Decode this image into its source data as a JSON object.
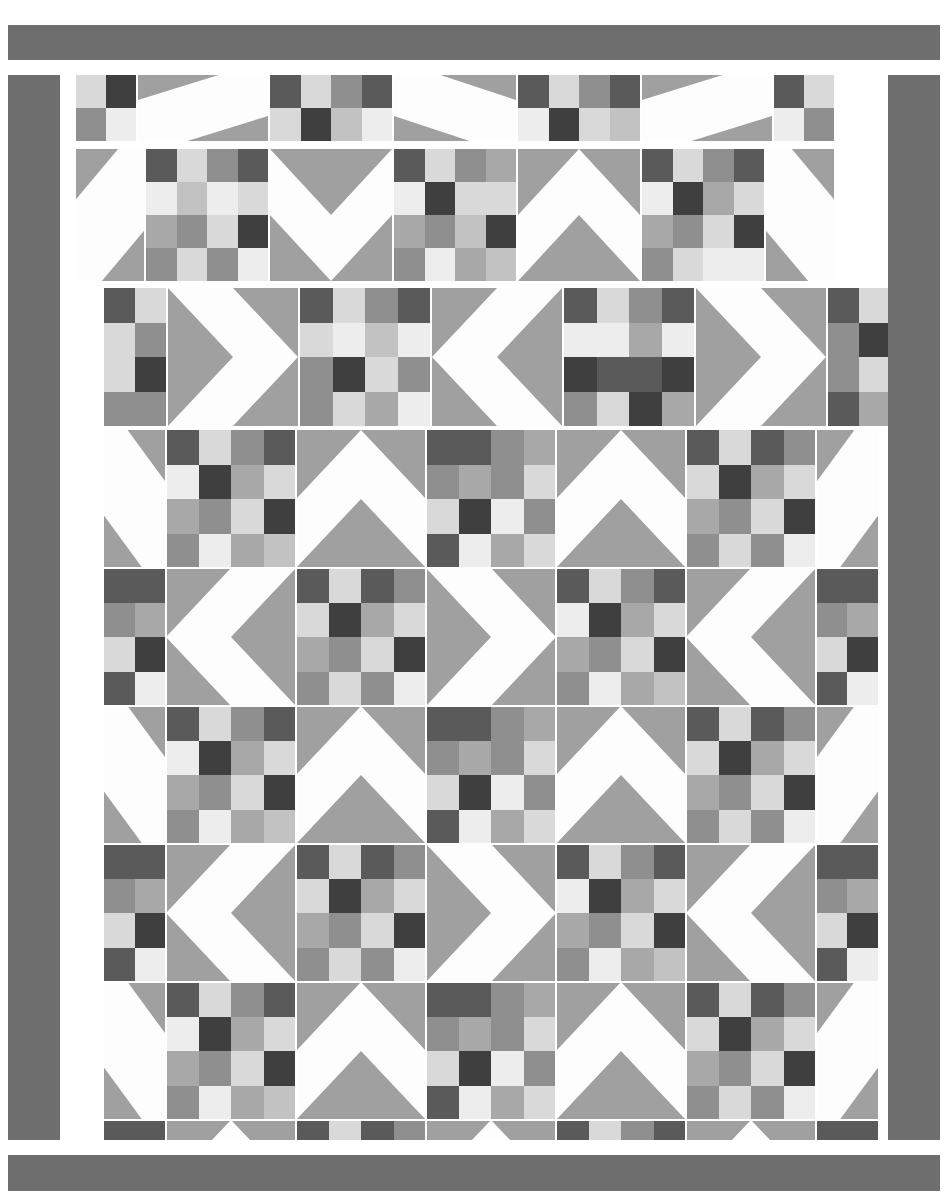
{
  "document": {
    "kind": "quilt-block-layout-diagram",
    "width": 947,
    "height": 1195,
    "background": "#ffffff"
  },
  "palette": {
    "white": "#fdfdfd",
    "lightest": "#ededed",
    "light": "#d9d9d9",
    "mid_light": "#c2c2c2",
    "mid": "#a8a8a8",
    "mid_dark": "#8f8f8f",
    "dark": "#6e6e6e",
    "darker": "#5a5a5a",
    "darkest": "#3f3f3f",
    "background_fabric": "#a0a0a0",
    "border_fabric": "#6e6e6e",
    "seam": "#ffffff"
  },
  "border": {
    "top_bar": {
      "x": 8,
      "y": 25,
      "w": 932,
      "h": 35,
      "color": "#6e6e6e"
    },
    "bottom_bar": {
      "x": 8,
      "y": 1155,
      "w": 932,
      "h": 36,
      "color": "#6e6e6e"
    },
    "left_bar": {
      "x": 8,
      "y": 75,
      "w": 52,
      "h": 1065,
      "color": "#6e6e6e"
    },
    "right_bar": {
      "x": 888,
      "y": 75,
      "w": 52,
      "h": 1065,
      "color": "#6e6e6e"
    }
  },
  "block_types": {
    "sixteen_patch": "4x4 grid of square patches in graded gray tones",
    "hst_diagonal": "square split corner-to-corner into background and white triangle",
    "chevron": "square with a white V / arrow shape on gray background"
  },
  "strip1": {
    "label": "top partial row",
    "x": 76,
    "y": 75,
    "w": 812,
    "h": 66,
    "cell_w": 114,
    "cell_h": 66,
    "gap": 2,
    "blocks": [
      {
        "type": "sixteen_patch",
        "w": 60,
        "cols": 2,
        "rows": 2,
        "patches": [
          [
            "light",
            "darkest"
          ],
          [
            "mid_dark",
            "lightest"
          ]
        ]
      },
      {
        "type": "hst_diagonal",
        "w": 130,
        "dir": "nw-se",
        "bg": "background_fabric"
      },
      {
        "type": "sixteen_patch",
        "w": 122,
        "cols": 4,
        "rows": 2,
        "patches": [
          [
            "darker",
            "light",
            "mid_dark",
            "darker"
          ],
          [
            "light",
            "darkest",
            "mid_light",
            "lightest"
          ]
        ]
      },
      {
        "type": "hst_diagonal",
        "w": 122,
        "dir": "ne-sw",
        "bg": "background_fabric"
      },
      {
        "type": "sixteen_patch",
        "w": 122,
        "cols": 4,
        "rows": 2,
        "patches": [
          [
            "darker",
            "light",
            "mid_dark",
            "darker"
          ],
          [
            "lightest",
            "darkest",
            "light",
            "mid_light"
          ]
        ]
      },
      {
        "type": "hst_diagonal",
        "w": 130,
        "dir": "nw-se",
        "bg": "background_fabric"
      },
      {
        "type": "sixteen_patch",
        "w": 60,
        "cols": 2,
        "rows": 2,
        "patches": [
          [
            "darker",
            "light"
          ],
          [
            "lightest",
            "mid_dark"
          ]
        ]
      }
    ]
  },
  "strip2": {
    "label": "second row",
    "x": 76,
    "y": 149,
    "w": 812,
    "h": 132,
    "blocks": [
      {
        "type": "hst_diagonal",
        "w": 68,
        "dir": "nw-se",
        "bg": "background_fabric"
      },
      {
        "type": "sixteen_patch",
        "w": 122,
        "cols": 4,
        "rows": 4,
        "patches": [
          [
            "darker",
            "light",
            "mid_dark",
            "darker"
          ],
          [
            "lightest",
            "mid_light",
            "lightest",
            "light"
          ],
          [
            "mid",
            "mid_dark",
            "light",
            "darkest"
          ],
          [
            "mid_dark",
            "light",
            "mid_dark",
            "lightest"
          ]
        ]
      },
      {
        "type": "chevron",
        "w": 122,
        "dir": "down",
        "bg": "background_fabric"
      },
      {
        "type": "sixteen_patch",
        "w": 122,
        "cols": 4,
        "rows": 4,
        "patches": [
          [
            "darker",
            "light",
            "mid_dark",
            "mid"
          ],
          [
            "lightest",
            "darkest",
            "light",
            "light"
          ],
          [
            "mid",
            "mid_dark",
            "mid_light",
            "darkest"
          ],
          [
            "mid_dark",
            "lightest",
            "mid",
            "mid_light"
          ]
        ]
      },
      {
        "type": "chevron",
        "w": 122,
        "dir": "up",
        "bg": "background_fabric"
      },
      {
        "type": "sixteen_patch",
        "w": 122,
        "cols": 4,
        "rows": 4,
        "patches": [
          [
            "darker",
            "light",
            "mid_dark",
            "darker"
          ],
          [
            "lightest",
            "darkest",
            "mid",
            "light"
          ],
          [
            "mid",
            "mid_dark",
            "light",
            "darkest"
          ],
          [
            "mid_dark",
            "light",
            "lightest",
            "lightest"
          ]
        ]
      },
      {
        "type": "hst_diagonal",
        "w": 68,
        "dir": "ne-sw",
        "bg": "background_fabric"
      }
    ]
  },
  "strip3": {
    "label": "third row",
    "x": 104,
    "y": 288,
    "w": 784,
    "h": 138,
    "blocks": [
      {
        "type": "sixteen_patch",
        "w": 62,
        "cols": 2,
        "rows": 4,
        "patches": [
          [
            "darker",
            "light"
          ],
          [
            "light",
            "mid_dark"
          ],
          [
            "light",
            "darkest"
          ],
          [
            "mid_dark",
            "mid_dark"
          ]
        ]
      },
      {
        "type": "chevron",
        "w": 130,
        "dir": "right",
        "bg": "background_fabric"
      },
      {
        "type": "sixteen_patch",
        "w": 130,
        "cols": 4,
        "rows": 4,
        "patches": [
          [
            "darker",
            "light",
            "mid_dark",
            "darker"
          ],
          [
            "light",
            "lightest",
            "mid_light",
            "lightest"
          ],
          [
            "mid_dark",
            "darkest",
            "light",
            "mid_dark"
          ],
          [
            "mid_dark",
            "light",
            "mid",
            "lightest"
          ]
        ]
      },
      {
        "type": "chevron",
        "w": 130,
        "dir": "left",
        "bg": "background_fabric"
      },
      {
        "type": "sixteen_patch",
        "w": 130,
        "cols": 4,
        "rows": 4,
        "patches": [
          [
            "darker",
            "light",
            "mid_dark",
            "darker"
          ],
          [
            "lightest",
            "lightest",
            "mid",
            "lightest"
          ],
          [
            "darkest",
            "darker",
            "darker",
            "darkest"
          ],
          [
            "mid_dark",
            "light",
            "darkest",
            "mid"
          ]
        ]
      },
      {
        "type": "chevron",
        "w": 130,
        "dir": "right",
        "bg": "background_fabric"
      },
      {
        "type": "sixteen_patch",
        "w": 62,
        "cols": 2,
        "rows": 4,
        "patches": [
          [
            "darker",
            "light"
          ],
          [
            "mid_dark",
            "darkest"
          ],
          [
            "mid_dark",
            "light"
          ],
          [
            "darker",
            "mid"
          ]
        ]
      }
    ]
  },
  "main_grid": {
    "label": "assembled quilt body",
    "x": 104,
    "y": 430,
    "w": 784,
    "h": 710,
    "rows": 6,
    "cols": 7,
    "col_widths": [
      62,
      130,
      130,
      130,
      130,
      130,
      62
    ],
    "row_heights": [
      138,
      138,
      138,
      138,
      138,
      62
    ],
    "layout": [
      [
        "hst-ne-sw",
        "patch",
        "chevron-up",
        "patch",
        "chevron-up",
        "patch",
        "hst-nw-se"
      ],
      [
        "patch",
        "chevron-left",
        "patch",
        "chevron-right",
        "patch",
        "chevron-left",
        "patch"
      ],
      [
        "hst-ne-sw",
        "patch",
        "chevron-up",
        "patch",
        "chevron-up",
        "patch",
        "hst-nw-se"
      ],
      [
        "patch",
        "chevron-left",
        "patch",
        "chevron-right",
        "patch",
        "chevron-left",
        "patch"
      ],
      [
        "hst-ne-sw",
        "patch",
        "chevron-up",
        "patch",
        "chevron-up",
        "patch",
        "hst-nw-se"
      ],
      [
        "patch",
        "chevron-down-half",
        "patch",
        "chevron-down-half",
        "patch",
        "chevron-down-half",
        "patch"
      ]
    ],
    "patch_variants": [
      [
        [
          "darker",
          "light",
          "mid_dark",
          "darker"
        ],
        [
          "light",
          "mid",
          "darkest",
          "light"
        ],
        [
          "lightest",
          "mid_dark",
          "lightest",
          "mid_light"
        ],
        [
          "mid_dark",
          "light",
          "mid_dark",
          "lightest"
        ]
      ],
      [
        [
          "darker",
          "light",
          "mid_dark",
          "darker"
        ],
        [
          "lightest",
          "darkest",
          "mid",
          "light"
        ],
        [
          "mid",
          "mid_dark",
          "light",
          "darkest"
        ],
        [
          "mid_dark",
          "lightest",
          "mid",
          "mid_light"
        ]
      ],
      [
        [
          "darker",
          "light",
          "mid_dark",
          "darker"
        ],
        [
          "light",
          "lightest",
          "mid_light",
          "lightest"
        ],
        [
          "mid_dark",
          "darkest",
          "light",
          "mid_dark"
        ],
        [
          "mid_dark",
          "light",
          "mid",
          "lightest"
        ]
      ],
      [
        [
          "darker",
          "darker",
          "mid_dark",
          "mid"
        ],
        [
          "mid_dark",
          "mid",
          "mid_dark",
          "light"
        ],
        [
          "light",
          "darkest",
          "lightest",
          "mid_dark"
        ],
        [
          "darker",
          "lightest",
          "mid",
          "light"
        ]
      ],
      [
        [
          "darker",
          "light",
          "mid_dark",
          "darker"
        ],
        [
          "lightest",
          "lightest",
          "mid",
          "lightest"
        ],
        [
          "darkest",
          "darker",
          "darker",
          "darkest"
        ],
        [
          "mid_dark",
          "light",
          "darkest",
          "mid"
        ]
      ],
      [
        [
          "darker",
          "light",
          "darker",
          "mid_dark"
        ],
        [
          "light",
          "darkest",
          "mid",
          "light"
        ],
        [
          "mid",
          "mid_dark",
          "light",
          "darkest"
        ],
        [
          "mid_dark",
          "light",
          "mid_dark",
          "lightest"
        ]
      ]
    ]
  },
  "meta": {
    "block_count_across": 7,
    "block_count_down": 8,
    "patch_grid": "4 x 4"
  }
}
